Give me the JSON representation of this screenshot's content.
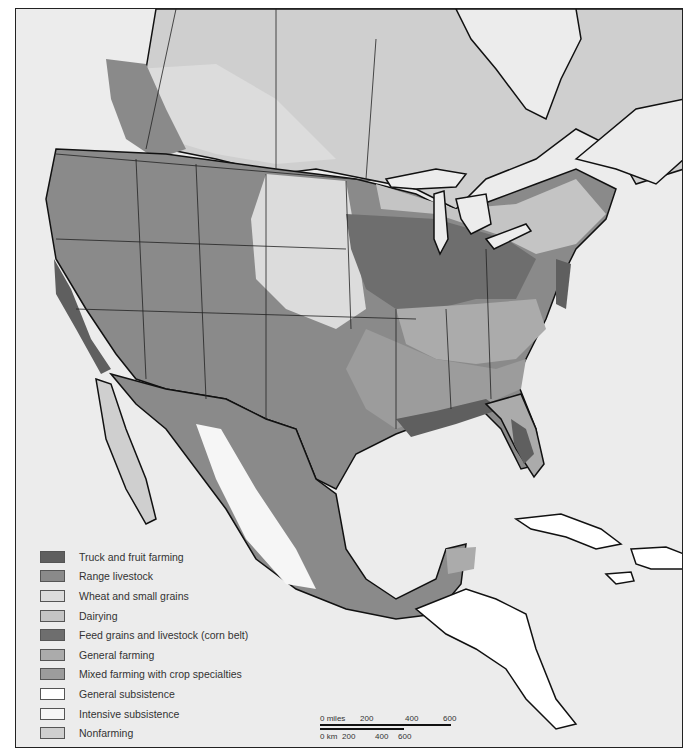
{
  "figure": {
    "type": "thematic-map"
  },
  "legend": {
    "items": [
      {
        "label": "Truck and fruit farming",
        "color": "#5f5f5f"
      },
      {
        "label": "Range livestock",
        "color": "#8a8a8a"
      },
      {
        "label": "Wheat and small grains",
        "color": "#dcdcdc"
      },
      {
        "label": "Dairying",
        "color": "#c4c4c4"
      },
      {
        "label": "Feed grains and livestock (corn belt)",
        "color": "#6e6e6e"
      },
      {
        "label": "General farming",
        "color": "#ababab"
      },
      {
        "label": "Mixed farming with crop specialties",
        "color": "#9c9c9c"
      },
      {
        "label": "General subsistence",
        "color": "#ffffff"
      },
      {
        "label": "Intensive subsistence",
        "color": "#f6f6f6"
      },
      {
        "label": "Nonfarming",
        "color": "#cfcfcf"
      }
    ]
  },
  "scale_bar": {
    "miles_label": "0 miles",
    "miles_ticks": [
      "200",
      "400",
      "600"
    ],
    "km_label": "0 km",
    "km_ticks": [
      "200",
      "400",
      "600"
    ]
  },
  "colors": {
    "water": "#ececec",
    "border": "#111111",
    "nonfarming": "#cfcfcf"
  }
}
